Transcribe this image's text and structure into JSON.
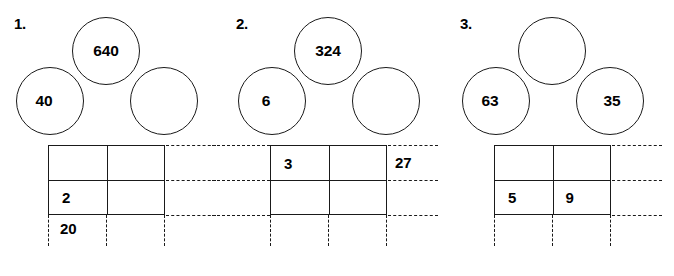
{
  "worksheet": {
    "type": "math-area-model-worksheet",
    "background_color": "#ffffff",
    "ink_color": "#1a1a1a",
    "problems": [
      {
        "number": "1.",
        "circles": {
          "top": "640",
          "left": "40",
          "right": ""
        },
        "grid": {
          "rows": 2,
          "columns": 2,
          "cells": {
            "top_left": "",
            "top_right": "",
            "bottom_left": "2",
            "bottom_right": ""
          }
        },
        "labels": {
          "bottom": "20",
          "right": ""
        },
        "dashes": {
          "right_side": true,
          "left_side": false,
          "bottom": true
        }
      },
      {
        "number": "2.",
        "circles": {
          "top": "324",
          "left": "6",
          "right": ""
        },
        "grid": {
          "rows": 2,
          "columns": 2,
          "cells": {
            "top_left": "3",
            "top_right": "",
            "bottom_left": "",
            "bottom_right": ""
          }
        },
        "labels": {
          "bottom": "",
          "right": "27"
        },
        "dashes": {
          "right_side": true,
          "left_side": true,
          "bottom": true
        }
      },
      {
        "number": "3.",
        "circles": {
          "top": "",
          "left": "63",
          "right": "35"
        },
        "grid": {
          "rows": 2,
          "columns": 2,
          "cells": {
            "top_left": "",
            "top_right": "",
            "bottom_left": "5",
            "bottom_right": "9"
          }
        },
        "labels": {
          "bottom": "",
          "right": ""
        },
        "dashes": {
          "right_side": true,
          "left_side": false,
          "bottom": true
        }
      }
    ]
  }
}
